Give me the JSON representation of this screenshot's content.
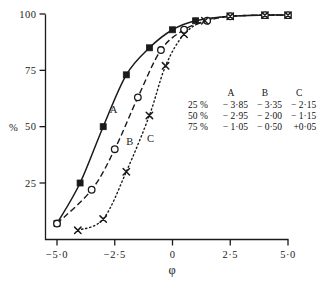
{
  "chart_data": {
    "type": "line",
    "title": "",
    "xlabel": "φ",
    "ylabel": "%",
    "xlim": [
      -5.6,
      5.6
    ],
    "ylim": [
      0,
      104
    ],
    "xticks": [
      -5.0,
      -2.5,
      0,
      2.5,
      5.0
    ],
    "xticklabels": [
      "−5·0",
      "−2·5",
      "0",
      "2·5",
      "5·0"
    ],
    "yticks": [
      25,
      50,
      75,
      100
    ],
    "yticklabels": [
      "25",
      "50",
      "75",
      "100"
    ],
    "grid": false,
    "legend": "inline-curve-labels",
    "series": [
      {
        "name": "A",
        "marker": "filled-square",
        "linestyle": "solid",
        "label_position": {
          "x": -2.55,
          "y": 56
        },
        "points": [
          {
            "x": -5.0,
            "y": 7
          },
          {
            "x": -4.0,
            "y": 25
          },
          {
            "x": -3.0,
            "y": 50
          },
          {
            "x": -2.0,
            "y": 73
          },
          {
            "x": -1.0,
            "y": 85
          },
          {
            "x": 0.0,
            "y": 93
          },
          {
            "x": 1.0,
            "y": 97
          },
          {
            "x": 2.5,
            "y": 99
          },
          {
            "x": 4.0,
            "y": 99.5
          },
          {
            "x": 5.0,
            "y": 99.5
          }
        ]
      },
      {
        "name": "B",
        "marker": "open-circle",
        "linestyle": "dashed",
        "label_position": {
          "x": -1.85,
          "y": 42
        },
        "points": [
          {
            "x": -5.0,
            "y": 7
          },
          {
            "x": -3.5,
            "y": 22
          },
          {
            "x": -2.5,
            "y": 40
          },
          {
            "x": -1.5,
            "y": 63
          },
          {
            "x": -0.5,
            "y": 84
          },
          {
            "x": 0.5,
            "y": 93
          },
          {
            "x": 1.5,
            "y": 97
          },
          {
            "x": 2.5,
            "y": 99
          },
          {
            "x": 4.0,
            "y": 99.5
          },
          {
            "x": 5.0,
            "y": 99.5
          }
        ]
      },
      {
        "name": "C",
        "marker": "cross",
        "linestyle": "dotted",
        "label_position": {
          "x": -0.95,
          "y": 43
        },
        "points": [
          {
            "x": -4.1,
            "y": 4
          },
          {
            "x": -3.0,
            "y": 9
          },
          {
            "x": -2.0,
            "y": 30
          },
          {
            "x": -1.0,
            "y": 55
          },
          {
            "x": -0.3,
            "y": 77
          },
          {
            "x": 0.5,
            "y": 91
          },
          {
            "x": 1.4,
            "y": 97
          },
          {
            "x": 2.5,
            "y": 99
          },
          {
            "x": 4.0,
            "y": 99.5
          },
          {
            "x": 5.0,
            "y": 99.5
          }
        ]
      }
    ]
  },
  "table": {
    "columns": [
      "A",
      "B",
      "C"
    ],
    "rows": [
      {
        "label": "25 %",
        "values": [
          "− 3·85",
          "− 3·35",
          "− 2·15"
        ]
      },
      {
        "label": "50 %",
        "values": [
          "− 2·95",
          "− 2·00",
          "− 1·15"
        ]
      },
      {
        "label": "75 %",
        "values": [
          "− 1·05",
          "− 0·50",
          "+0·05"
        ]
      }
    ]
  },
  "colors": {
    "ink": "#1a1a1a",
    "background": "#ffffff"
  }
}
